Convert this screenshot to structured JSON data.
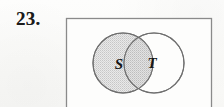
{
  "exercise": {
    "number_label": "23."
  },
  "figure": {
    "name": "venn-diagram-two-sets",
    "universal_set": {
      "shape": "rectangle",
      "label": "",
      "border_color": "#8a8a8a",
      "fill_color": "#fdfdfc",
      "cropped_at_bottom": true
    },
    "sets": [
      {
        "id": "S",
        "label": "S",
        "shape": "circle",
        "shaded": true,
        "fill_color": "#d9d9d9",
        "stroke_color": "#6f6f6f",
        "cx": 63,
        "cy": 51,
        "r": 30,
        "label_x": 59,
        "label_y": 57
      },
      {
        "id": "T",
        "label": "T",
        "shape": "circle",
        "shaded": false,
        "fill_color": "#ffffff",
        "stroke_color": "#6f6f6f",
        "cx": 94,
        "cy": 51,
        "r": 30,
        "label_x": 92,
        "label_y": 56
      }
    ],
    "intersection": {
      "shaded": true,
      "fill_color": "#d2d2d2",
      "stroke_color": "#6f6f6f"
    },
    "shading_pattern": "halftone-dots"
  },
  "colors": {
    "page_background": "#fbfbfa",
    "ink": "#1b1b1b",
    "rule": "#8a8a8a",
    "shade": "#d9d9d9"
  }
}
